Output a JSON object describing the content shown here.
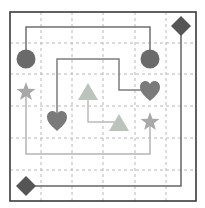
{
  "puzzle": {
    "title": "Connect matching shapes",
    "grid": {
      "cols": 6,
      "rows": 6,
      "left": 10,
      "top": 12,
      "right": 196,
      "bottom": 201
    },
    "colors": {
      "border": "#3a3a3a",
      "grid": "#b8b8b8",
      "circle": "#6a6a6a",
      "diamond": "#555555",
      "heart": "#7a7a7a",
      "star": "#a8a8a8",
      "triangle": "#bcc2bc",
      "circle_line": "#6f6f6f",
      "diamond_line": "#666666",
      "heart_line": "#7e7e7e",
      "star_line": "#b4b4b4",
      "triangle_line": "#b8bcb8"
    },
    "shapes": [
      {
        "id": "circle-a",
        "type": "circle",
        "cell": [
          0,
          1
        ]
      },
      {
        "id": "circle-b",
        "type": "circle",
        "cell": [
          4,
          1
        ]
      },
      {
        "id": "diamond-a",
        "type": "diamond",
        "cell": [
          5,
          0
        ]
      },
      {
        "id": "diamond-b",
        "type": "diamond",
        "cell": [
          0,
          5
        ]
      },
      {
        "id": "heart-a",
        "type": "heart",
        "cell": [
          4,
          2
        ]
      },
      {
        "id": "heart-b",
        "type": "heart",
        "cell": [
          1,
          3
        ]
      },
      {
        "id": "star-a",
        "type": "star",
        "cell": [
          0,
          2
        ]
      },
      {
        "id": "star-b",
        "type": "star",
        "cell": [
          4,
          3
        ]
      },
      {
        "id": "triangle-a",
        "type": "triangle",
        "cell": [
          2,
          2
        ]
      },
      {
        "id": "triangle-b",
        "type": "triangle",
        "cell": [
          3,
          3
        ]
      }
    ],
    "paths": [
      {
        "id": "circle-path",
        "points": [
          [
            26,
            59
          ],
          [
            26,
            27
          ],
          [
            150,
            27
          ],
          [
            150,
            59
          ]
        ]
      },
      {
        "id": "diamond-path",
        "points": [
          [
            26,
            186
          ],
          [
            181,
            186
          ],
          [
            181,
            27
          ]
        ]
      },
      {
        "id": "heart-path",
        "points": [
          [
            57,
            121
          ],
          [
            57,
            59
          ],
          [
            119,
            59
          ],
          [
            119,
            90
          ],
          [
            150,
            90
          ]
        ]
      },
      {
        "id": "star-path",
        "points": [
          [
            26,
            92
          ],
          [
            26,
            154
          ],
          [
            150,
            154
          ],
          [
            150,
            122
          ]
        ]
      },
      {
        "id": "triangle-path",
        "points": [
          [
            88,
            92
          ],
          [
            88,
            122
          ],
          [
            119,
            122
          ]
        ]
      }
    ]
  }
}
